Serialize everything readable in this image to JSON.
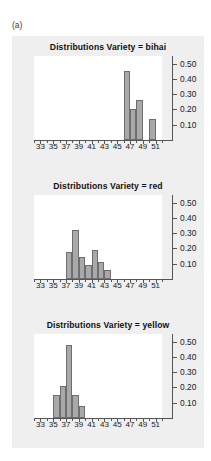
{
  "figure": {
    "panel_label": "(a)",
    "background": "#efefef",
    "bar_fill": "#a9a9a9",
    "bar_stroke": "#6e6e6e"
  },
  "chart_data": [
    {
      "type": "bar",
      "title": "Distributions Variety = bihai",
      "xlabel": "",
      "ylabel": "",
      "xlim": [
        32,
        52
      ],
      "ylim": [
        0,
        0.55
      ],
      "grid": false,
      "legend": "none",
      "xticks": [
        33,
        35,
        37,
        39,
        41,
        43,
        45,
        47,
        49,
        51
      ],
      "xtick_labels": [
        "33",
        "35",
        "37",
        "39",
        "41",
        "43",
        "45",
        "47",
        "49",
        "51"
      ],
      "yticks": [
        0.1,
        0.2,
        0.3,
        0.4,
        0.5
      ],
      "ytick_labels": [
        "0.10",
        "0.20",
        "0.30",
        "0.40",
        "0.50"
      ],
      "bin_width": 1,
      "bins": [
        {
          "x": 46.0,
          "value": 0.45
        },
        {
          "x": 47.0,
          "value": 0.2
        },
        {
          "x": 48.0,
          "value": 0.26
        },
        {
          "x": 50.0,
          "value": 0.14
        }
      ]
    },
    {
      "type": "bar",
      "title": "Distributions Variety = red",
      "xlabel": "",
      "ylabel": "",
      "xlim": [
        32,
        52
      ],
      "ylim": [
        0,
        0.55
      ],
      "grid": false,
      "legend": "none",
      "xticks": [
        33,
        35,
        37,
        39,
        41,
        43,
        45,
        47,
        49,
        51
      ],
      "xtick_labels": [
        "33",
        "35",
        "37",
        "39",
        "41",
        "43",
        "45",
        "47",
        "49",
        "51"
      ],
      "yticks": [
        0.1,
        0.2,
        0.3,
        0.4,
        0.5
      ],
      "ytick_labels": [
        "0.10",
        "0.20",
        "0.30",
        "0.40",
        "0.50"
      ],
      "bin_width": 1,
      "bins": [
        {
          "x": 37.0,
          "value": 0.18
        },
        {
          "x": 38.0,
          "value": 0.32
        },
        {
          "x": 39.0,
          "value": 0.145
        },
        {
          "x": 40.0,
          "value": 0.09
        },
        {
          "x": 41.0,
          "value": 0.19
        },
        {
          "x": 42.0,
          "value": 0.11
        },
        {
          "x": 43.0,
          "value": 0.06
        }
      ]
    },
    {
      "type": "bar",
      "title": "Distributions Variety = yellow",
      "xlabel": "",
      "ylabel": "",
      "xlim": [
        32,
        52
      ],
      "ylim": [
        0,
        0.55
      ],
      "grid": false,
      "legend": "none",
      "xticks": [
        33,
        35,
        37,
        39,
        41,
        43,
        45,
        47,
        49,
        51
      ],
      "xtick_labels": [
        "33",
        "35",
        "37",
        "39",
        "41",
        "43",
        "45",
        "47",
        "49",
        "51"
      ],
      "yticks": [
        0.1,
        0.2,
        0.3,
        0.4,
        0.5
      ],
      "ytick_labels": [
        "0.10",
        "0.20",
        "0.30",
        "0.40",
        "0.50"
      ],
      "bin_width": 1,
      "bins": [
        {
          "x": 35.0,
          "value": 0.15
        },
        {
          "x": 36.0,
          "value": 0.21
        },
        {
          "x": 37.0,
          "value": 0.48
        },
        {
          "x": 38.0,
          "value": 0.15
        },
        {
          "x": 39.0,
          "value": 0.08
        }
      ]
    }
  ]
}
